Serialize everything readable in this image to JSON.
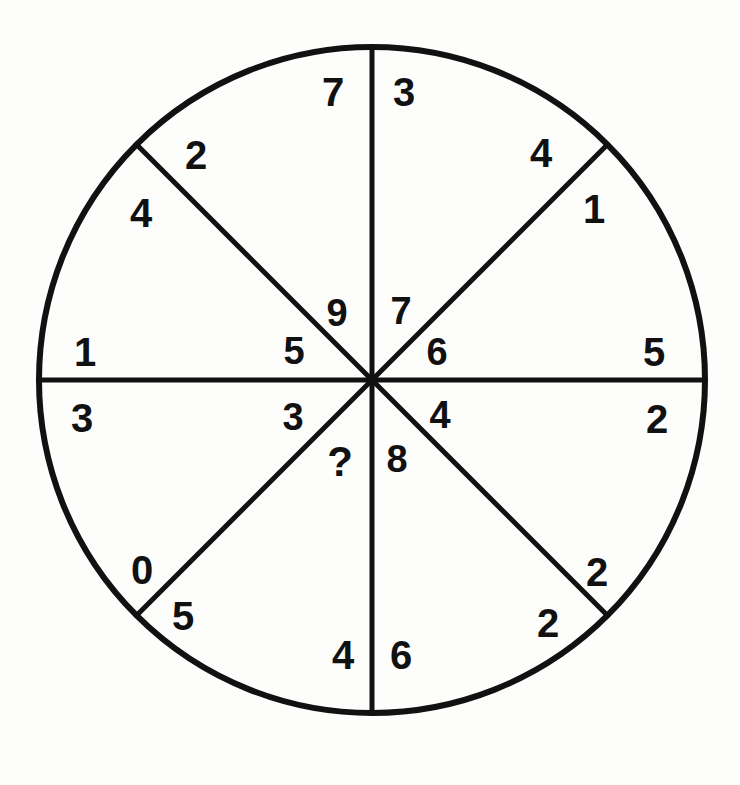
{
  "page": {
    "background_color": "#fdfdfb",
    "ink_color": "#111111"
  },
  "figure": {
    "type": "sectored-circle-number-puzzle",
    "geometry": {
      "center_x": 372,
      "center_y": 380,
      "radius": 333,
      "sector_count": 8,
      "diameter_count": 4,
      "stroke_color": "#111111",
      "rim_stroke_width": 6,
      "spoke_stroke_width": 5
    },
    "missing_value_marker": "?",
    "rim_labels": [
      {
        "name": "top-left",
        "value": "7",
        "x": 333,
        "y": 92
      },
      {
        "name": "top-right",
        "value": "3",
        "x": 404,
        "y": 92
      },
      {
        "name": "upper-left-ccw",
        "value": "2",
        "x": 196,
        "y": 155
      },
      {
        "name": "upper-left-cw",
        "value": "4",
        "x": 141,
        "y": 213
      },
      {
        "name": "upper-right-ccw",
        "value": "4",
        "x": 541,
        "y": 153
      },
      {
        "name": "upper-right-cw",
        "value": "1",
        "x": 594,
        "y": 209
      },
      {
        "name": "left-upper",
        "value": "1",
        "x": 85,
        "y": 352
      },
      {
        "name": "left-lower",
        "value": "3",
        "x": 82,
        "y": 418
      },
      {
        "name": "right-upper",
        "value": "5",
        "x": 654,
        "y": 352
      },
      {
        "name": "right-lower",
        "value": "2",
        "x": 657,
        "y": 419
      },
      {
        "name": "lower-left-ccw",
        "value": "0",
        "x": 142,
        "y": 570
      },
      {
        "name": "lower-left-cw",
        "value": "5",
        "x": 183,
        "y": 616
      },
      {
        "name": "lower-right-ccw",
        "value": "2",
        "x": 597,
        "y": 572
      },
      {
        "name": "lower-right-cw",
        "value": "2",
        "x": 548,
        "y": 623
      },
      {
        "name": "bottom-left",
        "value": "4",
        "x": 343,
        "y": 655
      },
      {
        "name": "bottom-right",
        "value": "6",
        "x": 401,
        "y": 655
      }
    ],
    "hub_labels": [
      {
        "name": "hub-top-left",
        "value": "9",
        "x": 337,
        "y": 313
      },
      {
        "name": "hub-top-right",
        "value": "7",
        "x": 401,
        "y": 311
      },
      {
        "name": "hub-left-upper",
        "value": "5",
        "x": 294,
        "y": 351
      },
      {
        "name": "hub-right-upper",
        "value": "6",
        "x": 437,
        "y": 352
      },
      {
        "name": "hub-left-lower",
        "value": "3",
        "x": 293,
        "y": 417
      },
      {
        "name": "hub-right-lower",
        "value": "4",
        "x": 440,
        "y": 415
      },
      {
        "name": "hub-bottom-left",
        "value": "?",
        "x": 340,
        "y": 462
      },
      {
        "name": "hub-bottom-right",
        "value": "8",
        "x": 397,
        "y": 459
      }
    ],
    "sectors": [
      {
        "name": "sector-n-ne",
        "rim_digits": [
          "3",
          "4"
        ],
        "hub_digit": "7"
      },
      {
        "name": "sector-ne-e",
        "rim_digits": [
          "1",
          "5"
        ],
        "hub_digit": "6"
      },
      {
        "name": "sector-e-se",
        "rim_digits": [
          "2",
          "2"
        ],
        "hub_digit": "4"
      },
      {
        "name": "sector-se-s",
        "rim_digits": [
          "2",
          "6"
        ],
        "hub_digit": "8"
      },
      {
        "name": "sector-s-sw",
        "rim_digits": [
          "4",
          "5"
        ],
        "hub_digit": "?"
      },
      {
        "name": "sector-sw-w",
        "rim_digits": [
          "0",
          "3"
        ],
        "hub_digit": "3"
      },
      {
        "name": "sector-w-nw",
        "rim_digits": [
          "1",
          "4"
        ],
        "hub_digit": "5"
      },
      {
        "name": "sector-nw-n",
        "rim_digits": [
          "2",
          "7"
        ],
        "hub_digit": "9"
      }
    ]
  }
}
